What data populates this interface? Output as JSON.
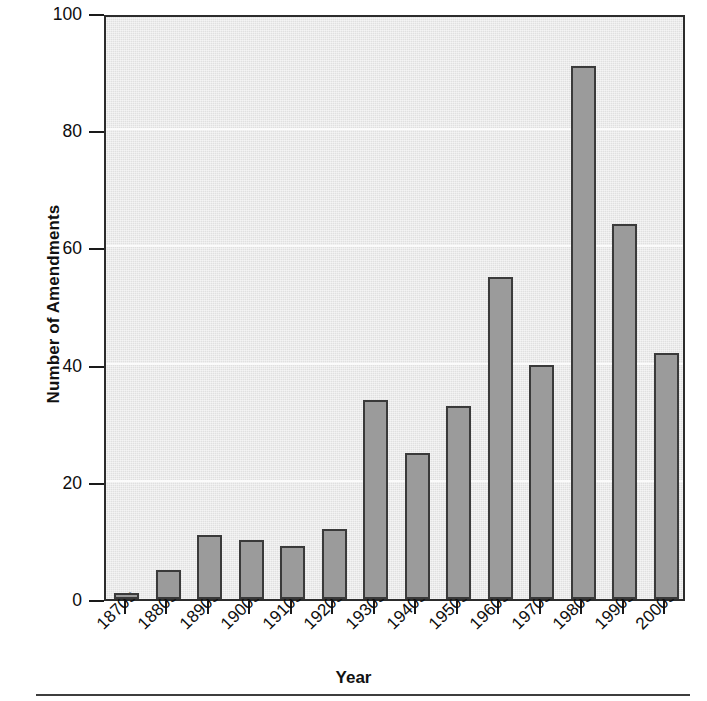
{
  "chart_data": {
    "type": "bar",
    "title": "",
    "subtitle": "",
    "xlabel": "Year",
    "ylabel": "Number of Amendments",
    "categories": [
      "1870s",
      "1880s",
      "1890s",
      "1900s",
      "1910s",
      "1920s",
      "1930s",
      "1940s",
      "1950s",
      "1960s",
      "1970s",
      "1980s",
      "1990s",
      "2000s"
    ],
    "values": [
      1,
      5,
      11,
      10,
      9,
      12,
      34,
      25,
      33,
      55,
      40,
      91,
      64,
      42
    ],
    "ylim": [
      0,
      100
    ],
    "yticks": [
      0,
      20,
      40,
      60,
      80,
      100
    ],
    "ytick_labels": [
      "0",
      "20",
      "40",
      "60",
      "80",
      "100"
    ],
    "grid": true,
    "gridlines_at": [
      20,
      40,
      60,
      80
    ],
    "legend": null,
    "legend_position": "none",
    "colors": {
      "bar_fill": "#9b9b9b",
      "bar_edge": "#3a3a3a",
      "plot_background": "#e9e9e9",
      "axis": "#2c2c2c",
      "gridline": "#fbfbfb",
      "text": "#0d0d0d"
    }
  }
}
